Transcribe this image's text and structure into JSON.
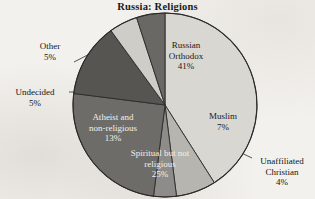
{
  "chart_data": {
    "type": "pie",
    "title": "Russia: Religions",
    "subtitle": "",
    "xlabel": "",
    "ylabel": "",
    "value_unit": "%",
    "legend_position": "none",
    "grid": false,
    "labels_on_slices": true,
    "categories": [
      "Russian Orthodox",
      "Muslim",
      "Unaffiliated Christian",
      "Spiritual but not religious",
      "Atheist and non-religious",
      "Undecided",
      "Other"
    ],
    "values": [
      41,
      7,
      4,
      25,
      13,
      5,
      5
    ],
    "slices": [
      {
        "name": "Russian Orthodox",
        "label_line1": "Russian",
        "label_line2": "Orthodox",
        "value": 41,
        "value_text": "41%",
        "color": "#d9d7d2",
        "label_placement": "inside",
        "leader_line": false
      },
      {
        "name": "Muslim",
        "label_line1": "Muslim",
        "label_line2": "",
        "value": 7,
        "value_text": "7%",
        "color": "#b7b5b0",
        "label_placement": "inside",
        "leader_line": false
      },
      {
        "name": "Unaffiliated Christian",
        "label_line1": "Unaffiliated",
        "label_line2": "Christian",
        "value": 4,
        "value_text": "4%",
        "color": "#8e8c88",
        "label_placement": "outside",
        "leader_line": true
      },
      {
        "name": "Spiritual but not religious",
        "label_line1": "Spiritual but not",
        "label_line2": "religious",
        "value": 25,
        "value_text": "25%",
        "color": "#6e6c68",
        "label_placement": "inside",
        "leader_line": false
      },
      {
        "name": "Atheist and non-religious",
        "label_line1": "Atheist and",
        "label_line2": "non-religious",
        "value": 13,
        "value_text": "13%",
        "color": "#575551",
        "label_placement": "inside",
        "leader_line": false
      },
      {
        "name": "Undecided",
        "label_line1": "Undecided",
        "label_line2": "",
        "value": 5,
        "value_text": "5%",
        "color": "#cfcdc8",
        "label_placement": "outside",
        "leader_line": true
      },
      {
        "name": "Other",
        "label_line1": "Other",
        "label_line2": "",
        "value": 5,
        "value_text": "5%",
        "color": "#6a6864",
        "label_placement": "outside",
        "leader_line": true
      }
    ],
    "total": 100,
    "colors": {
      "background": "#f3f1ed",
      "outline": "#2b2b2b",
      "text": "#1a1a1a",
      "text_on_dark": "#f2f0ec"
    }
  }
}
